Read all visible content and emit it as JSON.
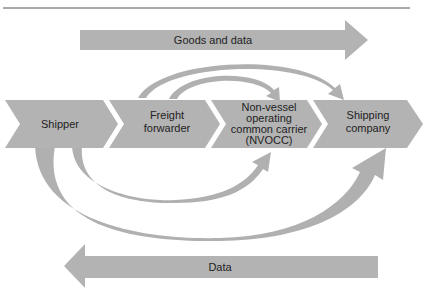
{
  "diagram": {
    "colors": {
      "shape_fill": "#b3b3b3",
      "arc_fill": "#b0b0b0",
      "text": "#222222",
      "rule": "#555555",
      "background": "#ffffff"
    },
    "top_arrow": {
      "label": "Goods and data",
      "direction": "right"
    },
    "bottom_arrow": {
      "label": "Data",
      "direction": "left"
    },
    "stages": [
      {
        "lines": [
          "Shipper"
        ]
      },
      {
        "lines": [
          "Freight",
          "forwarder"
        ]
      },
      {
        "lines": [
          "Non-vessel",
          "operating",
          "common carrier",
          "(NVOCC)"
        ]
      },
      {
        "lines": [
          "Shipping",
          "company"
        ]
      }
    ],
    "connections": [
      {
        "from": "Freight forwarder",
        "to": "Shipping company",
        "side": "top"
      },
      {
        "from": "Freight forwarder",
        "to": "Non-vessel operating common carrier (NVOCC)",
        "side": "top"
      },
      {
        "from": "Shipper",
        "to": "Non-vessel operating common carrier (NVOCC)",
        "side": "bottom"
      },
      {
        "from": "Shipper",
        "to": "Shipping company",
        "side": "bottom"
      }
    ]
  }
}
